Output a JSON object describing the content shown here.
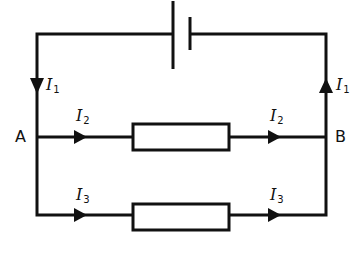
{
  "diagram": {
    "type": "circuit",
    "nodes": {
      "left": "A",
      "right": "B"
    },
    "currents": {
      "main_left": {
        "symbol": "I",
        "subscript": "1",
        "direction": "down"
      },
      "main_right": {
        "symbol": "I",
        "subscript": "1",
        "direction": "up"
      },
      "branch_top_in": {
        "symbol": "I",
        "subscript": "2",
        "direction": "right"
      },
      "branch_top_out": {
        "symbol": "I",
        "subscript": "2",
        "direction": "right"
      },
      "branch_bottom_in": {
        "symbol": "I",
        "subscript": "3",
        "direction": "right"
      },
      "branch_bottom_out": {
        "symbol": "I",
        "subscript": "3",
        "direction": "right"
      }
    },
    "components": [
      "battery-cell",
      "resistor-top",
      "resistor-bottom"
    ],
    "colors": {
      "stroke": "#111111",
      "background": "#ffffff"
    }
  }
}
